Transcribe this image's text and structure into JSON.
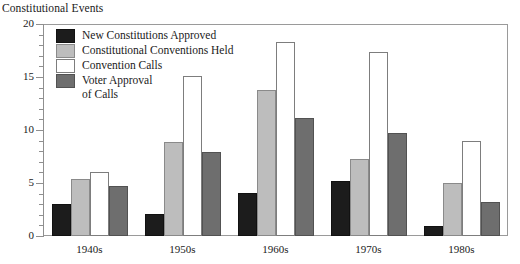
{
  "chart_data": {
    "type": "bar",
    "title": "Constitutional Events",
    "xlabel": "",
    "ylabel": "",
    "ylim": [
      0,
      20
    ],
    "yticks": [
      0,
      5,
      10,
      15,
      20
    ],
    "ytick_labels": [
      "0",
      "5",
      "10",
      "15",
      "20"
    ],
    "grid": false,
    "legend_position": "top-left inside plot",
    "categories": [
      "1940s",
      "1950s",
      "1960s",
      "1970s",
      "1980s"
    ],
    "series": [
      {
        "name": "New Constitutions Approved",
        "color": "#1c1c1c",
        "values": [
          3.0,
          2.1,
          4.1,
          5.2,
          0.9
        ]
      },
      {
        "name": "Constitutional Conventions Held",
        "color": "#bdbdbd",
        "values": [
          5.4,
          8.9,
          13.8,
          7.3,
          5.0
        ]
      },
      {
        "name": "Convention Calls",
        "color": "#ffffff",
        "values": [
          6.0,
          15.1,
          18.3,
          17.4,
          9.0
        ]
      },
      {
        "name": "Voter Approval of Calls",
        "color": "#6e6e6e",
        "values": [
          4.7,
          7.9,
          11.1,
          9.7,
          3.2
        ]
      }
    ]
  },
  "legend": {
    "entries": [
      {
        "label": "New Constitutions Approved",
        "label2": ""
      },
      {
        "label": "Constitutional Conventions Held",
        "label2": ""
      },
      {
        "label": "Convention Calls",
        "label2": ""
      },
      {
        "label": "Voter Approval",
        "label2": "of Calls"
      }
    ]
  }
}
